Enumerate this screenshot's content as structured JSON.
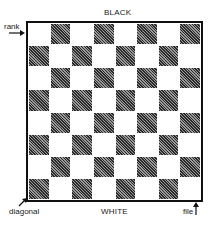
{
  "diagram": {
    "top_label": "BLACK",
    "bottom_label": "WHITE",
    "annotations": {
      "rank": "rank",
      "diagonal": "diagonal",
      "file": "file"
    },
    "board": {
      "rows": 8,
      "cols": 8,
      "top_left_square": "light",
      "dark_color": "#3a3a3a",
      "light_color": "#ffffff",
      "dark_pattern": "diagonal-hatch"
    }
  }
}
